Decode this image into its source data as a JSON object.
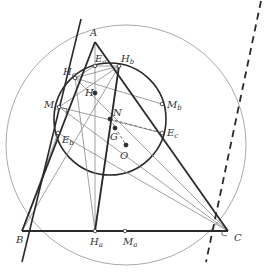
{
  "diagram": {
    "title": "",
    "colors": {
      "thick": "#2a2a2a",
      "thin": "#888888",
      "circle_outer": "#aaaaaa",
      "circle_nine": "#2a2a2a",
      "point": "#2a2a2a"
    },
    "points": {
      "A": {
        "x": 95,
        "y": 42,
        "label": "A",
        "sub": ""
      },
      "B": {
        "x": 22,
        "y": 231,
        "label": "B",
        "sub": ""
      },
      "C": {
        "x": 228,
        "y": 231,
        "label": "C",
        "sub": ""
      },
      "Ha": {
        "x": 95,
        "y": 231,
        "label": "H",
        "sub": "a"
      },
      "Hb": {
        "x": 119,
        "y": 66,
        "label": "H",
        "sub": "b"
      },
      "Hc": {
        "x": 75,
        "y": 78,
        "label": "H",
        "sub": "c"
      },
      "Ma": {
        "x": 125,
        "y": 231,
        "label": "M",
        "sub": "a"
      },
      "Mb": {
        "x": 162,
        "y": 104,
        "label": "M",
        "sub": "b"
      },
      "Mc": {
        "x": 59,
        "y": 107,
        "label": "M",
        "sub": "c"
      },
      "Ea": {
        "x": 95,
        "y": 66,
        "label": "E",
        "sub": "a"
      },
      "Eb": {
        "x": 58,
        "y": 133,
        "label": "E",
        "sub": "b"
      },
      "Ec": {
        "x": 162,
        "y": 133,
        "label": "E",
        "sub": "c"
      },
      "H": {
        "x": 95,
        "y": 93,
        "label": "H",
        "sub": ""
      },
      "N": {
        "x": 110,
        "y": 119,
        "label": "N",
        "sub": ""
      },
      "G": {
        "x": 115,
        "y": 128,
        "label": "G",
        "sub": ""
      },
      "O": {
        "x": 126,
        "y": 145,
        "label": "O",
        "sub": ""
      }
    },
    "circles": {
      "circumcircle": {
        "cx": 126,
        "cy": 145,
        "r": 120
      },
      "nine_point": {
        "cx": 110,
        "cy": 119,
        "r": 56
      }
    },
    "lines": {
      "tangent_solid": {
        "x1": 81,
        "y1": 19,
        "x2": 22,
        "y2": 262
      },
      "tangent_dashed": {
        "x1": 261,
        "y1": 1,
        "x2": 206,
        "y2": 262
      }
    }
  }
}
